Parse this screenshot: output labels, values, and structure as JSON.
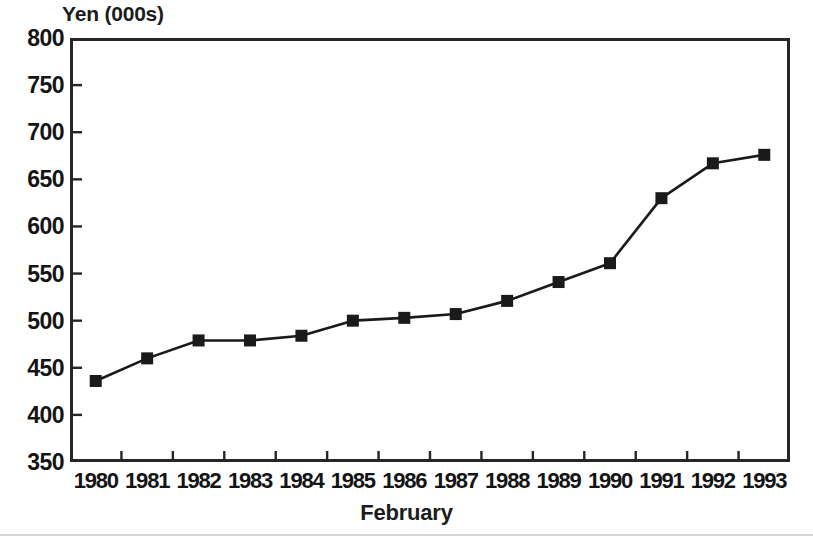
{
  "chart_data": {
    "type": "line",
    "title": "",
    "ylabel": "Yen (000s)",
    "xlabel": "February",
    "categories": [
      "1980",
      "1981",
      "1982",
      "1983",
      "1984",
      "1985",
      "1986",
      "1987",
      "1988",
      "1989",
      "1990",
      "1991",
      "1992",
      "1993"
    ],
    "values": [
      436,
      460,
      479,
      479,
      484,
      500,
      503,
      507,
      521,
      541,
      561,
      630,
      667,
      676
    ],
    "series": [
      {
        "name": "Yen (000s)",
        "values": [
          436,
          460,
          479,
          479,
          484,
          500,
          503,
          507,
          521,
          541,
          561,
          630,
          667,
          676
        ]
      }
    ],
    "ylim": [
      350,
      800
    ],
    "yticks": [
      350,
      400,
      450,
      500,
      550,
      600,
      650,
      700,
      750,
      800
    ],
    "ytick_labels": [
      "350",
      "400",
      "450",
      "500",
      "550",
      "600",
      "650",
      "700",
      "750",
      "800"
    ],
    "grid": false,
    "legend": "none",
    "marker": "square",
    "line_color": "#1a1a1a",
    "marker_color": "#1a1a1a",
    "axis_color": "#262626",
    "background": "#ffffff"
  }
}
